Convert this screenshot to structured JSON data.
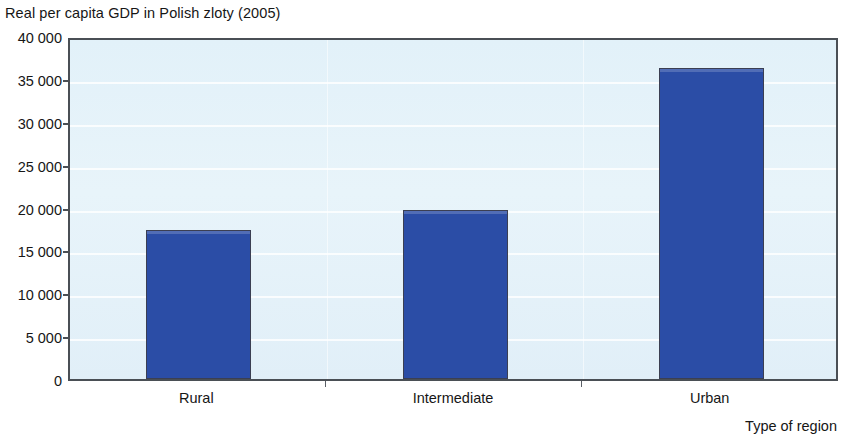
{
  "chart_data": {
    "type": "bar",
    "title": "Real per capita GDP in Polish zloty (2005)",
    "xlabel": "Type of region",
    "ylabel": "",
    "categories": [
      "Rural",
      "Intermediate",
      "Urban"
    ],
    "values": [
      17400,
      19700,
      36300
    ],
    "series": [
      {
        "name": "Real per capita GDP in Polish zloty (2005)",
        "values": [
          17400,
          19700,
          36300
        ]
      }
    ],
    "ylim": [
      0,
      40000
    ],
    "ytick_values": [
      0,
      5000,
      10000,
      15000,
      20000,
      25000,
      30000,
      35000,
      40000
    ],
    "ytick_labels": [
      "0",
      "5 000",
      "10 000",
      "15 000",
      "20 000",
      "25 000",
      "30 000",
      "35 000",
      "40 000"
    ],
    "grid": true,
    "grid_axis": "y",
    "legend": false,
    "legend_position": "none",
    "colors": {
      "bar": "#2b4da6",
      "bar_border": "#3b3f52",
      "plot_background": "#e4f2f9",
      "axis": "#4a4f55",
      "text": "#161616",
      "gridline": "#ffffff"
    }
  }
}
